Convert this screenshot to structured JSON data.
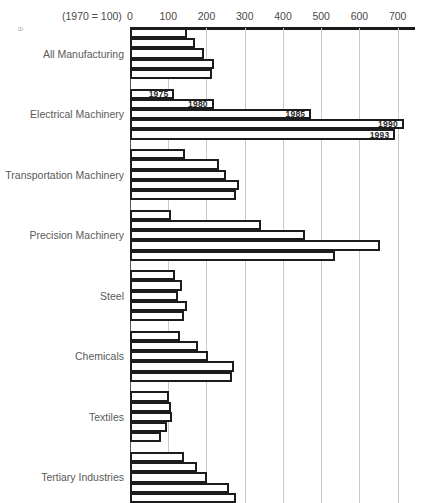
{
  "corner_mark": "ə",
  "axis_note": "(1970 = 100)",
  "chart_data": {
    "type": "bar",
    "orientation": "horizontal",
    "title": "",
    "subtitle": "",
    "xlabel": "(1970 = 100)",
    "ylabel": "",
    "xlim": [
      0,
      740
    ],
    "xticks": [
      0,
      100,
      200,
      300,
      400,
      500,
      600,
      700
    ],
    "xtick_labels": [
      "0",
      "100",
      "200",
      "300",
      "400",
      "500",
      "600",
      "700"
    ],
    "grid": true,
    "legend_position": "inline-bar-labels",
    "annotations": [
      "1975",
      "1980",
      "1985",
      "1990",
      "1993"
    ],
    "series": [
      {
        "name": "1975"
      },
      {
        "name": "1980"
      },
      {
        "name": "1985"
      },
      {
        "name": "1990"
      },
      {
        "name": "1993"
      }
    ],
    "categories": [
      "All Manufacturing",
      "Electrical Machinery",
      "Transportation Machinery",
      "Precision Machinery",
      "Steel",
      "Chemicals",
      "Textiles",
      "Tertiary Industries"
    ],
    "groups": [
      {
        "category": "All Manufacturing",
        "values": [
          149,
          170,
          193,
          219,
          214
        ],
        "bars": [
          {
            "year": "1975",
            "value": 149,
            "label": ""
          },
          {
            "year": "1980",
            "value": 170,
            "label": ""
          },
          {
            "year": "1985",
            "value": 193,
            "label": ""
          },
          {
            "year": "1990",
            "value": 219,
            "label": ""
          },
          {
            "year": "1993",
            "value": 214,
            "label": ""
          }
        ]
      },
      {
        "category": "Electrical Machinery",
        "values": [
          116,
          219,
          474,
          716,
          694
        ],
        "bars": [
          {
            "year": "1975",
            "value": 116,
            "label": "1975"
          },
          {
            "year": "1980",
            "value": 219,
            "label": "1980"
          },
          {
            "year": "1985",
            "value": 474,
            "label": "1985"
          },
          {
            "year": "1990",
            "value": 716,
            "label": "1990"
          },
          {
            "year": "1993",
            "value": 694,
            "label": "1993"
          }
        ]
      },
      {
        "category": "Transportation Machinery",
        "values": [
          144,
          232,
          252,
          285,
          278
        ],
        "bars": [
          {
            "year": "1975",
            "value": 144,
            "label": ""
          },
          {
            "year": "1980",
            "value": 232,
            "label": ""
          },
          {
            "year": "1985",
            "value": 252,
            "label": ""
          },
          {
            "year": "1990",
            "value": 285,
            "label": ""
          },
          {
            "year": "1993",
            "value": 278,
            "label": ""
          }
        ]
      },
      {
        "category": "Precision Machinery",
        "values": [
          108,
          343,
          457,
          654,
          536
        ],
        "bars": [
          {
            "year": "1975",
            "value": 108,
            "label": ""
          },
          {
            "year": "1980",
            "value": 343,
            "label": ""
          },
          {
            "year": "1985",
            "value": 457,
            "label": ""
          },
          {
            "year": "1990",
            "value": 654,
            "label": ""
          },
          {
            "year": "1993",
            "value": 536,
            "label": ""
          }
        ]
      },
      {
        "category": "Steel",
        "values": [
          118,
          135,
          125,
          150,
          140
        ],
        "bars": [
          {
            "year": "1975",
            "value": 118,
            "label": ""
          },
          {
            "year": "1980",
            "value": 135,
            "label": ""
          },
          {
            "year": "1985",
            "value": 125,
            "label": ""
          },
          {
            "year": "1990",
            "value": 150,
            "label": ""
          },
          {
            "year": "1993",
            "value": 140,
            "label": ""
          }
        ]
      },
      {
        "category": "Chemicals",
        "values": [
          131,
          178,
          204,
          272,
          268
        ],
        "bars": [
          {
            "year": "1975",
            "value": 131,
            "label": ""
          },
          {
            "year": "1980",
            "value": 178,
            "label": ""
          },
          {
            "year": "1985",
            "value": 204,
            "label": ""
          },
          {
            "year": "1990",
            "value": 272,
            "label": ""
          },
          {
            "year": "1993",
            "value": 268,
            "label": ""
          }
        ]
      },
      {
        "category": "Textiles",
        "values": [
          101,
          107,
          110,
          96,
          82
        ],
        "bars": [
          {
            "year": "1975",
            "value": 101,
            "label": ""
          },
          {
            "year": "1980",
            "value": 107,
            "label": ""
          },
          {
            "year": "1985",
            "value": 110,
            "label": ""
          },
          {
            "year": "1990",
            "value": 96,
            "label": ""
          },
          {
            "year": "1993",
            "value": 82,
            "label": ""
          }
        ]
      },
      {
        "category": "Tertiary Industries",
        "values": [
          142,
          176,
          202,
          260,
          276
        ],
        "bars": [
          {
            "year": "1975",
            "value": 142,
            "label": ""
          },
          {
            "year": "1980",
            "value": 176,
            "label": ""
          },
          {
            "year": "1985",
            "value": 202,
            "label": ""
          },
          {
            "year": "1990",
            "value": 260,
            "label": ""
          },
          {
            "year": "1993",
            "value": 276,
            "label": ""
          }
        ]
      }
    ]
  }
}
